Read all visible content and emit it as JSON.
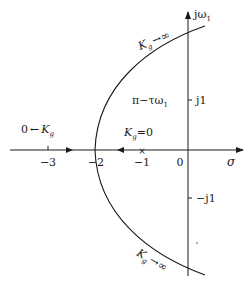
{
  "diagram": {
    "type": "root-locus",
    "axes": {
      "real_label": "σ",
      "imag_label": "jω",
      "imag_label_sub": "1",
      "real_ticks": [
        {
          "value": -3,
          "label": "−3"
        },
        {
          "value": -2,
          "label": "−2"
        },
        {
          "value": -1,
          "label": "−1"
        },
        {
          "value": 0,
          "label": "0"
        }
      ],
      "imag_ticks": [
        {
          "value": 1,
          "label": "j1"
        },
        {
          "value": -1,
          "label": "−j1"
        }
      ]
    },
    "pole": {
      "location": -1,
      "marker": "×"
    },
    "labels": {
      "upper_branch": {
        "k": "K",
        "k_sub": "g",
        "arrow": "→",
        "limit": "∞"
      },
      "lower_branch": {
        "k": "K",
        "k_sub": "g",
        "arrow": "→",
        "limit": "∞"
      },
      "left_real": {
        "zero": "0",
        "arrow": "←",
        "k": "K",
        "k_sub": "g"
      },
      "start": {
        "k": "K",
        "k_sub": "g",
        "eq": "=0"
      },
      "angle": {
        "text": "π−τω",
        "sub": "1"
      }
    },
    "colors": {
      "line": "#1a1a1a",
      "background": "#ffffff"
    }
  }
}
